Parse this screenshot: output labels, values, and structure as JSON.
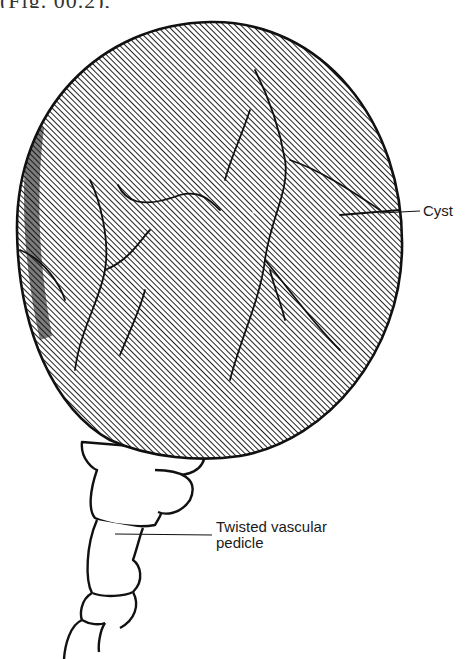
{
  "figure": {
    "top_text_fragment": "(Fig. 00.2),",
    "labels": {
      "cyst": "Cyst",
      "pedicle_line1": "Twisted vascular",
      "pedicle_line2": "pedicle"
    },
    "colors": {
      "ink": "#111111",
      "background": "#ffffff",
      "hatch": "#222222"
    }
  }
}
